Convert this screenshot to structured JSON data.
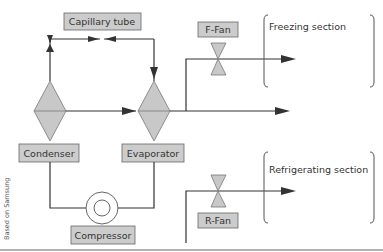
{
  "diagram": {
    "components": {
      "capillary_tube": "Capillary tube",
      "condenser": "Condenser",
      "evaporator": "Evaporator",
      "compressor": "Compressor",
      "f_fan": "F-Fan",
      "r_fan": "R-Fan"
    },
    "sections": {
      "freezing": "Freezing section",
      "refrigerating": "Refrigerating section"
    },
    "credit": "Based on Samsung",
    "colors": {
      "box_fill": "#cccccc",
      "line": "#333333",
      "diamond_fill": "#c8c8c8"
    }
  }
}
